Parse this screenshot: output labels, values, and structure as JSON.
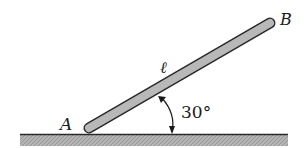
{
  "diagram": {
    "type": "inclined-rod",
    "labels": {
      "end_a": "A",
      "end_b": "B",
      "length": "ℓ",
      "angle": "30°"
    },
    "angle_degrees": 30,
    "colors": {
      "rod_fill": "#b8b8b8",
      "rod_outline": "#2a2a2a",
      "ground_line": "#2a2a2a",
      "ground_hatch": "#a9a9a9",
      "text": "#1a1a1a"
    }
  }
}
